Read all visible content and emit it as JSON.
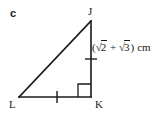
{
  "figure": {
    "part_label": "c",
    "shape": "right-triangle",
    "vertices": {
      "top": "J",
      "bottom_right": "K",
      "bottom_left": "L"
    },
    "right_angle_at": "K",
    "tick_marks": {
      "count_per_side": 1,
      "sides": [
        "JK",
        "LK"
      ],
      "meaning": "equal-length-sides"
    },
    "side_label": {
      "applies_to": "JK",
      "open_paren": "(",
      "radical_symbol_1": "√",
      "radicand_1": "2",
      "operator": "+",
      "radical_symbol_2": "√",
      "radicand_2": "3",
      "close_paren": ")",
      "unit": "cm",
      "plain_text": "(√2 + √3) cm"
    },
    "colors": {
      "stroke": "#1a1a1a",
      "background": "#ffffff"
    },
    "geometry": {
      "j_x": 91,
      "j_y": 21,
      "k_x": 91,
      "k_y": 97,
      "l_x": 19,
      "l_y": 97
    }
  }
}
